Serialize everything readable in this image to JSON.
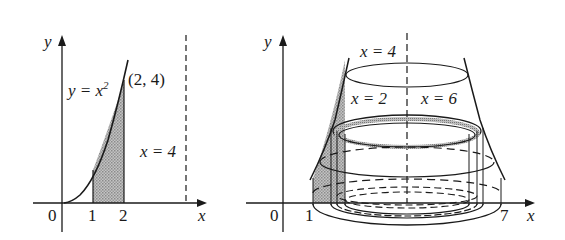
{
  "left_figure": {
    "y_axis_label": "y",
    "x_axis_label": "x",
    "origin_label": "0",
    "tick_labels": [
      "1",
      "2"
    ],
    "curve_label": "y = x²",
    "curve_label_base": "y = x",
    "curve_label_exp": "2",
    "point_label": "(2, 4)",
    "dashed_line_label": "x = 4",
    "shaded_region": "area under y = x² from x = 1 to x = 2"
  },
  "right_figure": {
    "y_axis_label": "y",
    "x_axis_label": "x",
    "origin_label": "0",
    "tick_labels": [
      "1",
      "7"
    ],
    "axis_of_rotation_label": "x = 4",
    "left_curve_label": "x = 2",
    "right_curve_label": "x = 6",
    "description": "solid of revolution about x = 4 with cylindrical shell"
  },
  "colors": {
    "ink": "#1a1a1a",
    "shade": "#a8a8a8",
    "background": "#ffffff"
  }
}
